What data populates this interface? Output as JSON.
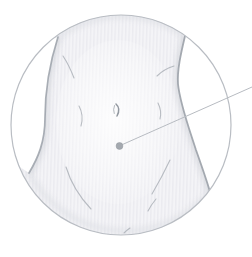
{
  "illustration": {
    "name": "lower-abdomen-injection-site",
    "description": "Grayscale medical line drawing of a lower abdomen with navel inside a circular frame; a callout line runs from a marked point below-right of the navel to the upper-right edge of the image"
  },
  "colors": {
    "background": "#ffffff",
    "frame_ring": "#b9bdc3",
    "skin_base": "#f4f4f7",
    "skin_stripe": "#e9e9ee",
    "skin_shade": "#c9ccd2",
    "edge_shade": "#dcdee3",
    "contour": "#9ba1a9",
    "crease": "#a9aeb5",
    "navel": "#9298a0",
    "marker_dot": "#a4a9af",
    "callout_line": "#b7bbc1"
  },
  "marker": {
    "x": "119.5",
    "y": "146",
    "r": "3.4"
  },
  "callout_line": {
    "x1": "122.5",
    "y1": "144.5",
    "x2": "252",
    "y2": "87"
  }
}
